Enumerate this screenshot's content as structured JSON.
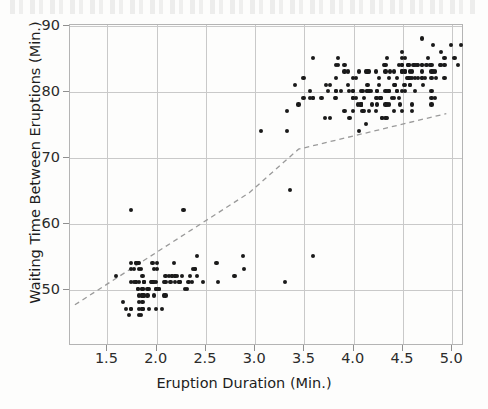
{
  "chart_data": {
    "type": "scatter",
    "title": "",
    "subtitle": "",
    "xlabel": "Eruption Duration (Min.)",
    "ylabel": "Waiting Time Between Eruptions (Min.)",
    "xlim": [
      1.12,
      5.12
    ],
    "ylim": [
      41.5,
      90.2
    ],
    "xticks": [
      1.5,
      2.0,
      2.5,
      3.0,
      3.5,
      4.0,
      4.5,
      5.0
    ],
    "xtick_labels": [
      "1.5",
      "2.0",
      "2.5",
      "3.0",
      "3.5",
      "4.0",
      "4.5",
      "5.0"
    ],
    "yticks": [
      50,
      60,
      70,
      80,
      90
    ],
    "ytick_labels": [
      "50",
      "60",
      "70",
      "80",
      "90"
    ],
    "grid": true,
    "legend": "none",
    "marker": {
      "shape": "circle",
      "color": "#1a1a1a",
      "size_px": 4.2
    },
    "gridline_color": "#c9c9c9",
    "frame_color": "#b4b4b4",
    "background_color": "#fdfdfc",
    "annotations": [
      {
        "type": "trendline",
        "style": "dashed",
        "color": "#9a9a9a",
        "points": [
          [
            1.18,
            47.6
          ],
          [
            2.95,
            64.6
          ],
          [
            3.45,
            71.2
          ],
          [
            4.95,
            76.6
          ]
        ]
      }
    ],
    "series": [
      {
        "name": "Old Faithful eruptions",
        "x": [
          3.6,
          1.8,
          3.333,
          2.283,
          4.533,
          2.883,
          4.7,
          3.6,
          1.95,
          4.35,
          1.833,
          3.917,
          4.2,
          1.75,
          4.7,
          2.167,
          1.75,
          4.8,
          1.6,
          4.25,
          1.8,
          1.75,
          3.45,
          3.067,
          4.533,
          3.6,
          1.967,
          4.083,
          3.85,
          4.433,
          4.3,
          4.467,
          3.367,
          4.033,
          3.833,
          2.017,
          1.867,
          4.833,
          1.833,
          4.783,
          4.35,
          1.883,
          4.567,
          1.75,
          4.533,
          3.317,
          3.833,
          2.1,
          4.633,
          2.0,
          4.8,
          4.716,
          1.833,
          4.833,
          1.733,
          4.883,
          3.717,
          1.667,
          4.567,
          4.317,
          2.233,
          4.5,
          1.75,
          4.8,
          1.817,
          4.4,
          4.167,
          4.7,
          2.067,
          4.7,
          4.033,
          1.967,
          4.5,
          4.0,
          1.983,
          5.067,
          2.017,
          4.567,
          3.883,
          3.6,
          4.133,
          4.333,
          4.1,
          2.633,
          4.067,
          4.933,
          3.95,
          4.517,
          2.167,
          4.0,
          2.2,
          4.333,
          1.867,
          4.817,
          1.833,
          4.3,
          4.667,
          3.75,
          1.867,
          4.9,
          2.483,
          4.367,
          2.1,
          4.5,
          4.05,
          1.867,
          4.7,
          1.783,
          4.85,
          3.683,
          4.733,
          2.3,
          4.9,
          4.417,
          1.7,
          4.633,
          2.317,
          4.6,
          1.817,
          4.417,
          2.617,
          4.067,
          4.25,
          1.967,
          4.6,
          3.767,
          1.917,
          4.5,
          2.267,
          4.65,
          1.867,
          4.167,
          2.8,
          4.333,
          1.833,
          4.383,
          1.883,
          4.933,
          2.033,
          3.733,
          4.233,
          2.233,
          4.533,
          4.817,
          4.333,
          1.983,
          4.633,
          2.017,
          5.1,
          1.8,
          5.033,
          4.0,
          2.4,
          4.6,
          3.567,
          4.0,
          4.5,
          4.083,
          1.8,
          3.967,
          2.2,
          4.15,
          2.0,
          3.833,
          3.5,
          4.583,
          2.367,
          5.0,
          1.933,
          4.617,
          1.917,
          2.083,
          4.583,
          3.333,
          4.167,
          4.333,
          4.5,
          2.417,
          4.0,
          4.167,
          1.883,
          4.583,
          4.25,
          3.767,
          2.033,
          4.433,
          4.083,
          1.833,
          4.417,
          2.183,
          4.8,
          1.833,
          4.8,
          4.1,
          3.966,
          4.233,
          3.5,
          4.366,
          2.25,
          4.667,
          2.1,
          4.35,
          4.133,
          1.867,
          4.6,
          1.783,
          4.367,
          3.85,
          1.933,
          4.5,
          2.383,
          4.7,
          1.867,
          3.833,
          3.417,
          4.233,
          2.4,
          4.8,
          2.0,
          4.15,
          1.867,
          4.267,
          1.75,
          4.483,
          4.0,
          4.117,
          4.083,
          4.267,
          3.917,
          4.55,
          4.083,
          2.417,
          4.183,
          2.217,
          4.45,
          1.883,
          1.85,
          4.283,
          3.95,
          2.333,
          4.15,
          2.35,
          4.933,
          2.9,
          4.583,
          3.833,
          2.083,
          4.367,
          2.133,
          4.35,
          2.2,
          4.45,
          3.567,
          4.5,
          4.15,
          3.817,
          3.917,
          4.45,
          2.0,
          4.283,
          4.767,
          4.533,
          1.85,
          4.25,
          1.983,
          2.25,
          4.75,
          4.117,
          2.15,
          4.417,
          1.817,
          4.467
        ],
        "y": [
          79,
          54,
          74,
          62,
          85,
          55,
          88,
          85,
          51,
          85,
          54,
          84,
          78,
          47,
          83,
          52,
          62,
          84,
          52,
          79,
          51,
          47,
          78,
          74,
          83,
          55,
          51,
          78,
          85,
          81,
          76,
          79,
          65,
          82,
          84,
          50,
          47,
          79,
          48,
          84,
          76,
          51,
          84,
          54,
          83,
          51,
          82,
          51,
          84,
          47,
          78,
          81,
          46,
          83,
          46,
          84,
          76,
          48,
          84,
          84,
          51,
          84,
          53,
          79,
          54,
          79,
          83,
          84,
          47,
          82,
          79,
          54,
          77,
          80,
          53,
          84,
          54,
          82,
          80,
          79,
          75,
          80,
          77,
          51,
          74,
          85,
          83,
          81,
          52,
          80,
          52,
          78,
          47,
          83,
          51,
          76,
          82,
          80,
          50,
          86,
          51,
          80,
          49,
          85,
          78,
          50,
          84,
          51,
          82,
          79,
          82,
          50,
          84,
          77,
          47,
          82,
          50,
          83,
          50,
          79,
          54,
          83,
          80,
          51,
          78,
          76,
          49,
          83,
          52,
          84,
          49,
          77,
          52,
          84,
          49,
          83,
          51,
          82,
          50,
          81,
          83,
          51,
          81,
          87,
          76,
          49,
          80,
          53,
          87,
          54,
          85,
          79,
          53,
          82,
          80,
          82,
          84,
          78,
          51,
          76,
          52,
          81,
          50,
          80,
          79,
          83,
          51,
          87,
          47,
          84,
          50,
          49,
          81,
          77,
          80,
          83,
          86,
          52,
          79,
          80,
          49,
          81,
          78,
          81,
          50,
          81,
          78,
          47,
          81,
          54,
          83,
          53,
          82,
          80,
          80,
          79,
          82,
          82,
          51,
          84,
          52,
          78,
          83,
          48,
          77,
          53,
          80,
          84,
          50,
          80,
          53,
          82,
          52,
          79,
          81,
          77,
          53,
          80,
          50,
          83,
          49,
          82,
          51,
          78,
          77,
          77,
          80,
          81,
          77,
          82,
          78,
          55,
          80,
          52,
          80,
          51,
          53,
          79,
          81,
          51,
          80,
          52,
          84,
          53,
          82,
          80,
          51,
          78,
          52,
          80,
          51,
          82,
          79,
          83,
          80,
          79,
          83,
          80,
          51,
          79,
          85,
          80,
          46,
          80,
          51,
          51,
          84,
          79,
          51,
          83,
          50,
          84
        ]
      }
    ]
  },
  "axes": {
    "x": {
      "label": "Eruption Duration (Min.)",
      "ticks": [
        "1.5",
        "2.0",
        "2.5",
        "3.0",
        "3.5",
        "4.0",
        "4.5",
        "5.0"
      ]
    },
    "y": {
      "label": "Waiting Time Between Eruptions (Min.)",
      "ticks": [
        "50",
        "60",
        "70",
        "80",
        "90"
      ]
    }
  }
}
